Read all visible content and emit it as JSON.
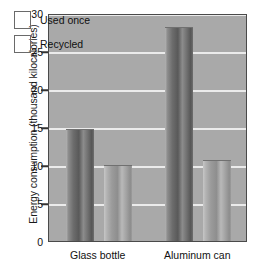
{
  "chart_data": {
    "type": "bar",
    "title": "",
    "subtitle": "",
    "xlabel": "",
    "ylabel": "Energy consumption (thousand kilocalories)",
    "categories": [
      "Glass bottle",
      "Aluminum can"
    ],
    "series": [
      {
        "name": "Used once",
        "values": [
          14.8,
          28.2
        ],
        "color": "#5e5e5e"
      },
      {
        "name": "Recycled",
        "values": [
          10.0,
          10.6
        ],
        "color": "#9e9e9e"
      }
    ],
    "ylim": [
      0,
      30
    ],
    "yticks": [
      0,
      5,
      10,
      15,
      20,
      25,
      30
    ],
    "ytick_labels": [
      "0",
      "5",
      "10",
      "15",
      "20",
      "25",
      "30"
    ],
    "grid": "horizontal",
    "legend_position": "top-left-inside",
    "plot_background": "#a9a9a9",
    "gridline_color": "#f2f2f2",
    "border_color": "#4a4a4a"
  }
}
